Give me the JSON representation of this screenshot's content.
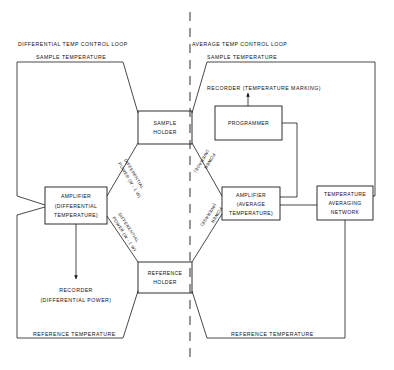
{
  "diagram": {
    "ink_color": "#1a1a1a",
    "background": "#ffffff",
    "loops": {
      "left_title": "DIFFERENTIAL TEMP CONTROL LOOP",
      "right_title": "AVERAGE TEMP CONTROL LOOP"
    },
    "boxes": {
      "sample_holder": {
        "line1": "SAMPLE",
        "line2": "HOLDER"
      },
      "reference_holder": {
        "line1": "REFERENCE",
        "line2": "HOLDER"
      },
      "amplifier_diff": {
        "line1": "AMPLIFIER",
        "line2": "(DIFFERENTIAL",
        "line3": "TEMPERATURE)"
      },
      "amplifier_avg": {
        "line1": "AMPLIFIER",
        "line2": "(AVERAGE",
        "line3": "TEMPERATURE)"
      },
      "programmer": {
        "line1": "PROGRAMMER"
      },
      "temp_avg_network": {
        "line1": "TEMPERATURE",
        "line2": "AVERAGING",
        "line3": "NETWORK"
      }
    },
    "labels": {
      "sample_temperature_left": "SAMPLE TEMPERATURE",
      "sample_temperature_right": "SAMPLE TEMPERATURE",
      "reference_temperature_left": "REFERENCE TEMPERATURE",
      "reference_temperature_right": "REFERENCE TEMPERATURE",
      "recorder_temperature_marking": "RECORDER  (TEMPERATURE MARKING)",
      "recorder_differential_power_line1": "RECORDER",
      "recorder_differential_power_line2": "(DIFFERENTIAL POWER)",
      "diff_power_upper_line1": "DIFFERENTIAL",
      "diff_power_upper_line2": "POWER (W - 1 W)",
      "diff_power_lower_line1": "DIFFERENTIAL",
      "diff_power_lower_line2": "POWER (W - 1 W)",
      "avg_power_upper_line1": "POWER",
      "avg_power_upper_line2": "(AVERAGE)",
      "avg_power_lower_line1": "POWER",
      "avg_power_lower_line2": "(AVERAGE)"
    }
  }
}
